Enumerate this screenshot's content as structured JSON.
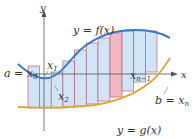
{
  "diagram": {
    "type": "area-between-curves-riemann",
    "axes": {
      "x_label": "x",
      "y_label": "y"
    },
    "curves": [
      {
        "name": "f",
        "label": "y = f(x)",
        "color": "#3a78c2"
      },
      {
        "name": "g",
        "label": "y = g(x)",
        "color": "#e0a53a"
      }
    ],
    "point_labels": {
      "a": "a = x",
      "a_sub": "0",
      "x1": "x",
      "x1_sub": "1",
      "x2": "x",
      "x2_sub": "2",
      "xn1": "x",
      "xn1_sub": "n−1",
      "b": "b = x",
      "b_sub": "n"
    },
    "colors": {
      "rect_fill": "#cfe4f7",
      "rect_stroke": "#c8607a",
      "highlight_fill": "#f4b8c4",
      "axis": "#555555"
    },
    "rectangles": [
      {
        "x": 28,
        "w": 11.5,
        "top": 66,
        "bottom": 108,
        "highlight": false
      },
      {
        "x": 39.5,
        "w": 11.7,
        "top": 78,
        "bottom": 108,
        "highlight": false
      },
      {
        "x": 51.2,
        "w": 11.7,
        "top": 72,
        "bottom": 108,
        "highlight": false
      },
      {
        "x": 62.9,
        "w": 11.7,
        "top": 61,
        "bottom": 107,
        "highlight": false
      },
      {
        "x": 74.6,
        "w": 11.7,
        "top": 50,
        "bottom": 106,
        "highlight": false
      },
      {
        "x": 86.3,
        "w": 11.7,
        "top": 43,
        "bottom": 104,
        "highlight": false
      },
      {
        "x": 98,
        "w": 12,
        "top": 38,
        "bottom": 101,
        "highlight": false
      },
      {
        "x": 110,
        "w": 12,
        "top": 33,
        "bottom": 97,
        "highlight": true
      },
      {
        "x": 122,
        "w": 11.7,
        "top": 31,
        "bottom": 91,
        "highlight": false
      },
      {
        "x": 133.7,
        "w": 11.7,
        "top": 30,
        "bottom": 82,
        "highlight": false
      },
      {
        "x": 145.4,
        "w": 11.6,
        "top": 31,
        "bottom": 72,
        "highlight": false
      }
    ]
  }
}
